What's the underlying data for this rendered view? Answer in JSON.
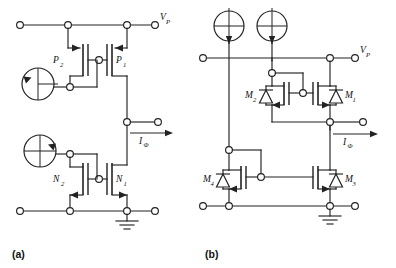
{
  "figure": {
    "type": "circuit-schematic-pair",
    "background_color": "#ffffff",
    "line_color": "#222222",
    "panels": [
      {
        "id": "a",
        "caption": "(a)",
        "description": "CMOS complementary cross-coupled pair with two current sources",
        "supply_label": "V",
        "supply_sub": "P",
        "current_label": "I",
        "current_sub": "Φ",
        "devices": [
          {
            "name": "P",
            "sub": "1",
            "type": "pmos"
          },
          {
            "name": "P",
            "sub": "2",
            "type": "pmos"
          },
          {
            "name": "N",
            "sub": "1",
            "type": "nmos"
          },
          {
            "name": "N",
            "sub": "2",
            "type": "nmos"
          }
        ],
        "sources": [
          {
            "name": "current-source-upper",
            "arrow": "up-left"
          },
          {
            "name": "current-source-lower",
            "arrow": "up-right"
          }
        ],
        "ground": true
      },
      {
        "id": "b",
        "caption": "(b)",
        "description": "Power MOSFET bridge with body diodes and two current sources",
        "supply_label": "V",
        "supply_sub": "P",
        "current_label": "I",
        "current_sub": "Φ",
        "devices": [
          {
            "name": "M",
            "sub": "1",
            "type": "pmos-body-diode"
          },
          {
            "name": "M",
            "sub": "2",
            "type": "pmos-body-diode"
          },
          {
            "name": "M",
            "sub": "3",
            "type": "nmos-body-diode"
          },
          {
            "name": "M",
            "sub": "4",
            "type": "nmos-body-diode"
          }
        ],
        "sources": [
          {
            "name": "current-source-left",
            "arrow": "down"
          },
          {
            "name": "current-source-right",
            "arrow": "down"
          }
        ],
        "ground": true
      }
    ]
  }
}
